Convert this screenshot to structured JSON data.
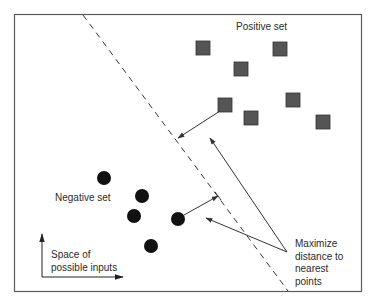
{
  "labels": {
    "positive_set": "Positive set",
    "negative_set": "Negative set",
    "space_line1": "Space of",
    "space_line2": "possible inputs",
    "maximize_line1": "Maximize",
    "maximize_line2": "distance to",
    "maximize_line3": "nearest",
    "maximize_line4": "points"
  },
  "colors": {
    "frame": "#5a5a5a",
    "square_fill": "#555555",
    "square_stroke": "#333333",
    "circle_fill": "#111111",
    "line": "#333333"
  },
  "positive_points": [
    {
      "x": 203,
      "y": 48
    },
    {
      "x": 241,
      "y": 69
    },
    {
      "x": 280,
      "y": 49
    },
    {
      "x": 225,
      "y": 105
    },
    {
      "x": 293,
      "y": 100
    },
    {
      "x": 251,
      "y": 118
    },
    {
      "x": 323,
      "y": 122
    }
  ],
  "negative_points": [
    {
      "x": 104,
      "y": 178
    },
    {
      "x": 142,
      "y": 196
    },
    {
      "x": 134,
      "y": 216
    },
    {
      "x": 178,
      "y": 219
    },
    {
      "x": 151,
      "y": 246
    }
  ],
  "decision_boundary": {
    "x1": 83,
    "y1": 15,
    "x2": 288,
    "y2": 292,
    "style": "dashed"
  }
}
